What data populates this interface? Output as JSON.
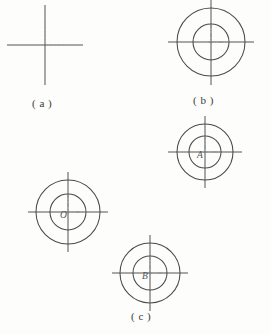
{
  "figure": {
    "background_color": "#fdfdfc",
    "line_color": "#4a4a4a",
    "label_color": "#555555",
    "caption_color": "#3a3a3a",
    "width": 271,
    "height": 335
  },
  "captions": {
    "a": "( a )",
    "b": "( b )",
    "c": "( c )"
  },
  "parts": [
    {
      "id": "part-a",
      "caption": "( a )",
      "cx": 45,
      "cy": 45,
      "circles": [],
      "crosshair": {
        "half_length_x": 38,
        "half_length_y": 40
      },
      "label": ""
    },
    {
      "id": "part-b",
      "caption": "( b )",
      "cx": 211,
      "cy": 42,
      "circles": [
        {
          "name": "outer-circle",
          "r": 34
        },
        {
          "name": "inner-circle",
          "r": 18
        }
      ],
      "crosshair": {
        "half_length_x": 43,
        "half_length_y": 43
      },
      "label": ""
    },
    {
      "id": "part-c-a",
      "caption": "",
      "cx": 205,
      "cy": 152,
      "circles": [
        {
          "name": "outer-circle",
          "r": 28
        },
        {
          "name": "inner-circle",
          "r": 16
        }
      ],
      "crosshair": {
        "half_length_x": 37,
        "half_length_y": 36
      },
      "label": "A"
    },
    {
      "id": "part-c-o",
      "caption": "",
      "cx": 68,
      "cy": 212,
      "circles": [
        {
          "name": "outer-circle",
          "r": 32
        },
        {
          "name": "inner-circle",
          "r": 18
        }
      ],
      "crosshair": {
        "half_length_x": 40,
        "half_length_y": 40
      },
      "label": "O"
    },
    {
      "id": "part-c-b",
      "caption": "",
      "cx": 150,
      "cy": 273,
      "circles": [
        {
          "name": "outer-circle",
          "r": 30
        },
        {
          "name": "inner-circle",
          "r": 17
        }
      ],
      "crosshair": {
        "half_length_x": 38,
        "half_length_y": 38
      },
      "label": "B"
    }
  ],
  "labels": {
    "center_o": "O",
    "center_a": "A",
    "center_b": "B"
  }
}
